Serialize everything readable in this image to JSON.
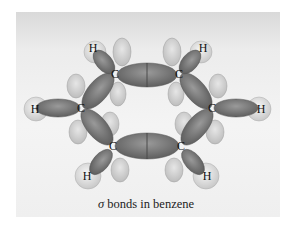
{
  "figure": {
    "caption_symbol": "σ",
    "caption_text": " bonds in benzene",
    "colors": {
      "background": "#eeeeee",
      "bond_dark": "#7a7a7a",
      "lobe_light": "#d0d0d0",
      "hydrogen": "#e4e4e4"
    },
    "atoms": {
      "carbons": [
        {
          "label": "C",
          "x": 115,
          "y": 74
        },
        {
          "label": "C",
          "x": 179,
          "y": 74
        },
        {
          "label": "C",
          "x": 81,
          "y": 108
        },
        {
          "label": "C",
          "x": 212,
          "y": 108
        },
        {
          "label": "C",
          "x": 113,
          "y": 146
        },
        {
          "label": "C",
          "x": 181,
          "y": 146
        }
      ],
      "hydrogens": [
        {
          "label": "H",
          "x": 93,
          "y": 48
        },
        {
          "label": "H",
          "x": 203,
          "y": 48
        },
        {
          "label": "H",
          "x": 35,
          "y": 109
        },
        {
          "label": "H",
          "x": 261,
          "y": 109
        },
        {
          "label": "H",
          "x": 87,
          "y": 176
        },
        {
          "label": "H",
          "x": 207,
          "y": 176
        }
      ]
    }
  }
}
